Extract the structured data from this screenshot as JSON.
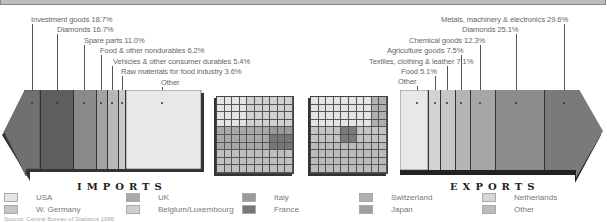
{
  "chart_data": {
    "type": "bar",
    "imports": {
      "title": "IMPORTS",
      "segments": [
        {
          "label": "Investment goods 18.7%",
          "value": 18.7,
          "color": "#6e6e6e"
        },
        {
          "label": "Diamonds 16.7%",
          "value": 16.7,
          "color": "#5a5a5a"
        },
        {
          "label": "Spare parts 11.0%",
          "value": 11.0,
          "color": "#8a8a8a"
        },
        {
          "label": "Food & other nondurables 6.2%",
          "value": 6.2,
          "color": "#a3a3a3"
        },
        {
          "label": "Vehicles & other consumer durables 5.4%",
          "value": 5.4,
          "color": "#b8b8b8"
        },
        {
          "label": "Raw materials for food industry 3.6%",
          "value": 3.6,
          "color": "#cacaca"
        },
        {
          "label": "Other",
          "value": 38.4,
          "color": "#e6e6e6"
        }
      ]
    },
    "exports": {
      "title": "EXPORTS",
      "segments": [
        {
          "label": "Other",
          "value": 13.3,
          "color": "#e6e6e6"
        },
        {
          "label": "Food 5.1%",
          "value": 5.1,
          "color": "#d3d3d3"
        },
        {
          "label": "Textiles, clothing & leather 7.1%",
          "value": 7.1,
          "color": "#c7c7c7"
        },
        {
          "label": "Agriculture goods 7.5%",
          "value": 7.5,
          "color": "#b5b5b5"
        },
        {
          "label": "Chemical goods 12.3%",
          "value": 12.3,
          "color": "#a7a7a7"
        },
        {
          "label": "Diamonds 25.1%",
          "value": 25.1,
          "color": "#8c8c8c"
        },
        {
          "label": "Metals, machinery & electronics 29.6%",
          "value": 29.6,
          "color": "#7a7a7a"
        }
      ]
    },
    "partner_grids": {
      "imports_grid": "10x10 waffle of import partners",
      "exports_grid": "10x10 waffle of export partners"
    },
    "legend": [
      {
        "label": "USA",
        "color": "#e4e4e4"
      },
      {
        "label": "W. Germany",
        "color": "#c4c4c4"
      },
      {
        "label": "UK",
        "color": "#a8a8a8"
      },
      {
        "label": "Belgium/Luxembourg",
        "color": "#cfcfcf"
      },
      {
        "label": "Italy",
        "color": "#9a9a9a"
      },
      {
        "label": "France",
        "color": "#767676"
      },
      {
        "label": "Switzerland",
        "color": "#b0b0b0"
      },
      {
        "label": "Japan",
        "color": "#a0a0a0"
      },
      {
        "label": "Netherlands",
        "color": "#d6d6d6"
      },
      {
        "label": "Other",
        "color": "#bcbcbc"
      }
    ]
  },
  "labels": {
    "imports_title": "IMPORTS",
    "exports_title": "EXPORTS",
    "imp": [
      "Investment goods 18.7%",
      "Diamonds 16.7%",
      "Spare parts 11.0%",
      "Food & other nondurables 6.2%",
      "Vehicles & other consumer durables 5.4%",
      "Raw materials for food industry 3.6%",
      "Other"
    ],
    "exp": [
      "Metals, machinery & electronics 29.6%",
      "Diamonds 25.1%",
      "Chemical goods 12.3%",
      "Agriculture goods 7.5%",
      "Textiles, clothing & leather 7.1%",
      "Food 5.1%",
      "Other"
    ]
  },
  "legend": {
    "usa": "USA",
    "wgermany": "W. Germany",
    "uk": "UK",
    "belgium": "Belgium/Luxembourg",
    "italy": "Italy",
    "france": "France",
    "switzerland": "Switzerland",
    "japan": "Japan",
    "netherlands": "Netherlands",
    "other": "Other"
  },
  "source": "Source: Central Bureau of Statistics 1986"
}
